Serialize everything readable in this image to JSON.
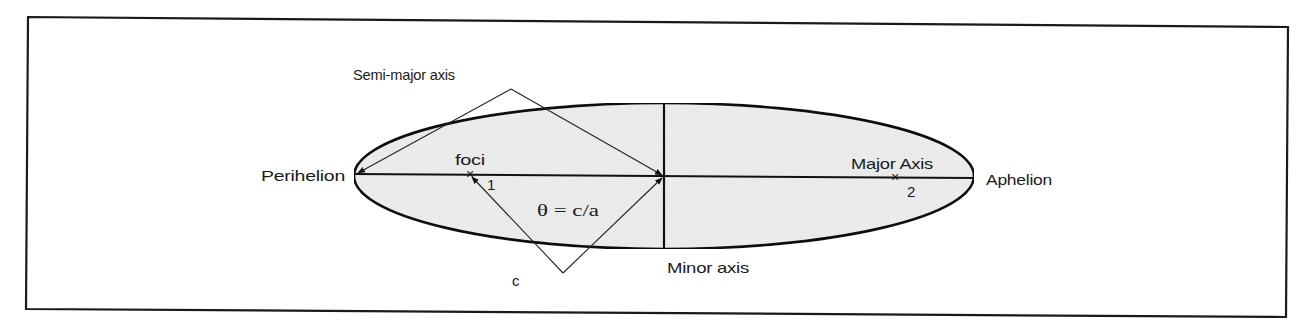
{
  "figure": {
    "title": "",
    "colors": {
      "frame": "#1a1a1a",
      "ellipse_fill": "#ececec",
      "ellipse_stroke": "#111111",
      "line": "#222222",
      "text": "#1a1a1a"
    }
  },
  "labels": {
    "semi_major_axis": "Semi-major axis",
    "perihelion": "Perihelion",
    "aphelion": "Aphelion",
    "foci": "foci",
    "focus_1": "1",
    "focus_2": "2",
    "focus_marker": "×",
    "major_axis": "Major Axis",
    "minor_axis": "Minor axis",
    "eccentricity_equation": "θ = c/a",
    "c_label": "c"
  },
  "geometry": {
    "ellipse": {
      "cx": 664,
      "cy": 176,
      "rx": 310,
      "ry": 73
    },
    "perihelion_point": [
      354,
      174
    ],
    "aphelion_point": [
      974,
      178
    ],
    "focus_1": [
      470,
      174
    ],
    "focus_2": [
      895,
      177
    ],
    "center": [
      664,
      176
    ],
    "semi_major_apex": [
      511,
      89
    ],
    "c_apex": [
      563,
      273
    ]
  }
}
